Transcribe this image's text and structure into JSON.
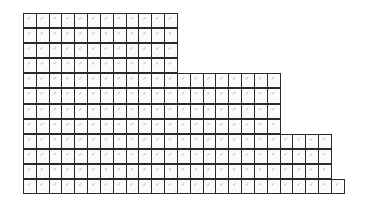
{
  "grid": {
    "rows": [
      12,
      12,
      12,
      12,
      20,
      20,
      20,
      20,
      24,
      24,
      24,
      25
    ],
    "cell_mark": "✓",
    "border_color": "#2a2a2a",
    "mark_color": "#9a9a9a"
  }
}
